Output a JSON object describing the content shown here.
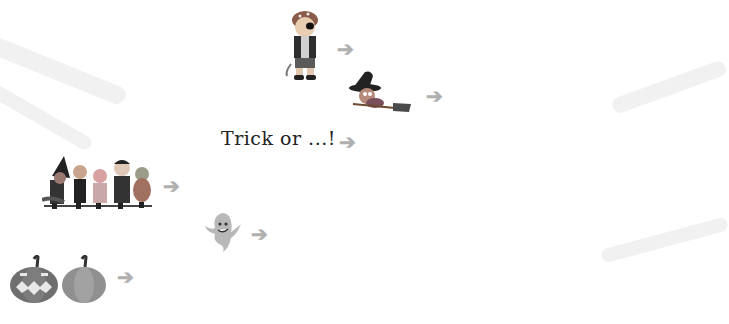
{
  "puzzle": {
    "type": "crossword",
    "theme": "Halloween",
    "shaded_column_letters": [
      "S",
      "W",
      "",
      "",
      "T",
      ""
    ],
    "colors": {
      "grid_line": "#555555",
      "shaded": "#d9d9d9",
      "hint_letter": "#bdbdbd",
      "given_letter": "#111111",
      "arrow": "#b0b0b0"
    }
  },
  "clues": [
    {
      "number": "1",
      "picture": "pirate-costume-icon",
      "answer_hint": "COSTUME"
    },
    {
      "number": "2",
      "picture": "witch-on-broom-icon"
    },
    {
      "number": "3",
      "text": "Trick or ...!"
    },
    {
      "number": "4",
      "picture": "costumed-kids-icon"
    },
    {
      "number": "5",
      "picture": "ghost-icon"
    },
    {
      "number": "6",
      "picture": "pumpkins-icon"
    }
  ],
  "rows": [
    {
      "number": "1",
      "cells": [
        {
          "l": "C",
          "s": "given"
        },
        {
          "l": "O",
          "s": "faint italic"
        },
        {
          "l": "S",
          "s": "faint",
          "shaded": true
        },
        {
          "l": "T",
          "s": "faint"
        },
        {
          "l": "U",
          "s": "faint"
        },
        {
          "l": "M",
          "s": "given"
        },
        {
          "l": "E",
          "s": "faint"
        }
      ]
    },
    {
      "number": "2",
      "cells": [
        {
          "l": "W",
          "s": "given",
          "shaded": true
        },
        {
          "l": ""
        },
        {
          "l": ""
        },
        {
          "l": ""
        },
        {
          "l": ""
        }
      ]
    },
    {
      "number": "3",
      "cells": [
        {
          "l": "T",
          "s": "given"
        },
        {
          "l": ""
        },
        {
          "l": "",
          "shaded": true
        },
        {
          "l": ""
        },
        {
          "l": "T",
          "s": "given"
        }
      ]
    },
    {
      "number": "4",
      "cells": [
        {
          "l": "H",
          "s": "given"
        },
        {
          "l": ""
        },
        {
          "l": ""
        },
        {
          "l": "L",
          "s": "given"
        },
        {
          "l": ""
        },
        {
          "l": "W",
          "s": "given"
        },
        {
          "l": "",
          "shaded": true
        },
        {
          "l": ""
        },
        {
          "l": ""
        }
      ]
    },
    {
      "number": "5",
      "cells": [
        {
          "l": "G",
          "s": "given"
        },
        {
          "l": ""
        },
        {
          "l": ""
        },
        {
          "l": ""
        },
        {
          "l": "T",
          "s": "given",
          "shaded": true
        }
      ]
    },
    {
      "number": "6",
      "cells": [
        {
          "l": "P",
          "s": "given"
        },
        {
          "l": ""
        },
        {
          "l": ""
        },
        {
          "l": ""
        },
        {
          "l": ""
        },
        {
          "l": ""
        },
        {
          "l": ""
        },
        {
          "l": "",
          "shaded": true
        }
      ]
    }
  ],
  "labels": {
    "clue3_text": "Trick or ...!",
    "arrow_glyph": "➔"
  }
}
